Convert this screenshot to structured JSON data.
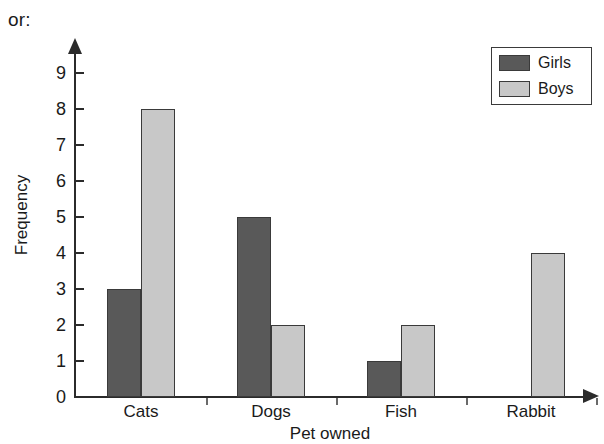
{
  "prefix": {
    "label": "or:"
  },
  "chart_data": {
    "type": "bar",
    "title": "",
    "xlabel": "Pet owned",
    "ylabel": "Frequency",
    "categories": [
      "Cats",
      "Dogs",
      "Fish",
      "Rabbit"
    ],
    "series": [
      {
        "name": "Girls",
        "color": "#595959",
        "values": [
          3,
          5,
          1,
          0
        ]
      },
      {
        "name": "Boys",
        "color": "#c8c8c8",
        "values": [
          8,
          2,
          2,
          4
        ]
      }
    ],
    "ylim": [
      0,
      9
    ],
    "yticks": [
      0,
      1,
      2,
      3,
      4,
      5,
      6,
      7,
      8,
      9
    ],
    "ytick_labels": [
      "0",
      "1",
      "2",
      "3",
      "4",
      "5",
      "6",
      "7",
      "8",
      "9"
    ],
    "grid": false,
    "legend_position": "top-right",
    "legend_entries": [
      "Girls",
      "Boys"
    ],
    "axis_arrows": true,
    "bar_outline_color": "#3a3a3a",
    "axis_color": "#2b2b2b"
  }
}
